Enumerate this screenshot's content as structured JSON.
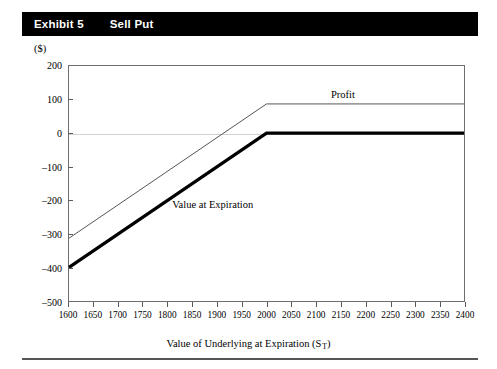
{
  "header": {
    "exhibit_label": "Exhibit 5",
    "title": "Sell Put"
  },
  "unit_label": "($)",
  "chart_data": {
    "type": "line",
    "title": "Sell Put",
    "xlabel": "Value of Underlying at Expiration (S T)",
    "xlabel_main": "Value of Underlying at Expiration (S",
    "xlabel_sub": "T",
    "xlabel_tail": ")",
    "ylabel": "($)",
    "xlim": [
      1600,
      2400
    ],
    "ylim": [
      -500,
      200
    ],
    "xticks": [
      1600,
      1650,
      1700,
      1750,
      1800,
      1850,
      1900,
      1950,
      2000,
      2050,
      2100,
      2150,
      2200,
      2250,
      2300,
      2350,
      2400
    ],
    "yticks": [
      200,
      100,
      0,
      -100,
      -200,
      -300,
      -400,
      -500
    ],
    "grid": false,
    "zero_line": true,
    "legend_position": "inline-annotations",
    "strike": 2000,
    "premium": 87,
    "series": [
      {
        "name": "Value at Expiration",
        "style": "thick-black",
        "color": "#000000",
        "width": 3.2,
        "x": [
          1600,
          2000,
          2400
        ],
        "values": [
          -400,
          0,
          0
        ],
        "label": "Value at Expiration",
        "label_x": 1810,
        "label_y": -195
      },
      {
        "name": "Profit",
        "style": "thin-black",
        "color": "#555555",
        "width": 1,
        "x": [
          1600,
          2000,
          2400
        ],
        "values": [
          -313,
          87,
          87
        ],
        "label": "Profit",
        "label_x": 2130,
        "label_y": 128
      }
    ]
  }
}
